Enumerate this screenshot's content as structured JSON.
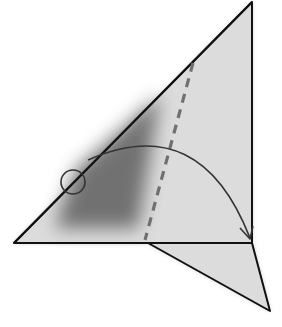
{
  "diagram": {
    "type": "origami-fold-step",
    "colors": {
      "paper": "#dcdcdc",
      "shade": "#6a6a6a",
      "outline": "#111111",
      "crease": "#707070",
      "arrow": "#333333",
      "background": "#ffffff"
    },
    "shapes": {
      "main_triangle": "252,2 14,243 252,243",
      "lower_flap": "148,243 252,243 270,311",
      "shade_region": "60,228 140,230 165,90 120,130 78,168",
      "crease_line": {
        "x1": 193,
        "y1": 63,
        "x2": 145,
        "y2": 240
      },
      "fold_arc": "M 88 160 Q 200 110 250 238",
      "arrowhead": "240,226 250,239 254,226",
      "reference_circle": {
        "cx": 73,
        "cy": 182,
        "r": 12
      }
    },
    "labels": {
      "crease": "valley fold line",
      "arrow": "fold direction",
      "circle": "reference point"
    }
  }
}
